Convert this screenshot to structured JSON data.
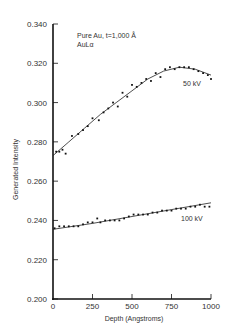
{
  "chart_data": {
    "type": "scatter",
    "title": "",
    "annotation_lines": [
      "Pure Au, t=1,000 Å",
      "AuLα"
    ],
    "xlabel": "Depth (Angstroms)",
    "ylabel": "Generated Intensity",
    "xlim": [
      0,
      1000
    ],
    "ylim": [
      0.2,
      0.34
    ],
    "xticks": [
      0,
      250,
      500,
      750,
      1000
    ],
    "xtick_labels": [
      "0",
      "250",
      "500",
      "750",
      "1000"
    ],
    "yticks": [
      0.2,
      0.22,
      0.24,
      0.26,
      0.28,
      0.3,
      0.32,
      0.34
    ],
    "ytick_labels": [
      "0.200",
      "0.220",
      "0.240",
      "0.260",
      "0.280",
      "0.300",
      "0.320",
      "0.340"
    ],
    "grid": false,
    "legend": "inline labels",
    "series": [
      {
        "name": "50 kV",
        "label": "50 kV",
        "fit_curve": {
          "x": [
            0,
            100,
            200,
            300,
            400,
            500,
            600,
            700,
            800,
            900,
            1000
          ],
          "y": [
            0.273,
            0.28,
            0.287,
            0.294,
            0.3,
            0.306,
            0.312,
            0.316,
            0.318,
            0.317,
            0.314
          ]
        },
        "points": {
          "x": [
            20,
            40,
            60,
            80,
            120,
            160,
            190,
            220,
            250,
            290,
            320,
            350,
            380,
            410,
            440,
            470,
            500,
            530,
            560,
            590,
            620,
            650,
            680,
            710,
            740,
            770,
            800,
            830,
            860,
            890,
            920,
            950,
            980,
            1000
          ],
          "y": [
            0.275,
            0.275,
            0.276,
            0.274,
            0.283,
            0.284,
            0.286,
            0.288,
            0.292,
            0.291,
            0.295,
            0.297,
            0.3,
            0.298,
            0.305,
            0.303,
            0.309,
            0.308,
            0.31,
            0.312,
            0.311,
            0.315,
            0.313,
            0.317,
            0.318,
            0.317,
            0.318,
            0.318,
            0.318,
            0.317,
            0.316,
            0.315,
            0.314,
            0.312
          ]
        }
      },
      {
        "name": "100 kV",
        "label": "100 kV",
        "fit_curve": {
          "x": [
            0,
            250,
            500,
            750,
            1000
          ],
          "y": [
            0.2355,
            0.2385,
            0.242,
            0.2455,
            0.249
          ]
        },
        "points": {
          "x": [
            10,
            40,
            70,
            100,
            130,
            160,
            190,
            220,
            250,
            280,
            300,
            330,
            360,
            390,
            420,
            450,
            480,
            510,
            540,
            570,
            600,
            630,
            660,
            690,
            720,
            750,
            780,
            810,
            840,
            870,
            900,
            930,
            960,
            990
          ],
          "y": [
            0.236,
            0.237,
            0.237,
            0.237,
            0.237,
            0.237,
            0.238,
            0.239,
            0.239,
            0.241,
            0.239,
            0.24,
            0.24,
            0.24,
            0.24,
            0.241,
            0.242,
            0.243,
            0.243,
            0.243,
            0.243,
            0.244,
            0.244,
            0.245,
            0.245,
            0.245,
            0.246,
            0.246,
            0.246,
            0.247,
            0.247,
            0.248,
            0.247,
            0.247
          ]
        }
      }
    ]
  },
  "plot": {
    "left": 53,
    "right": 211,
    "top": 24,
    "bottom": 299
  }
}
